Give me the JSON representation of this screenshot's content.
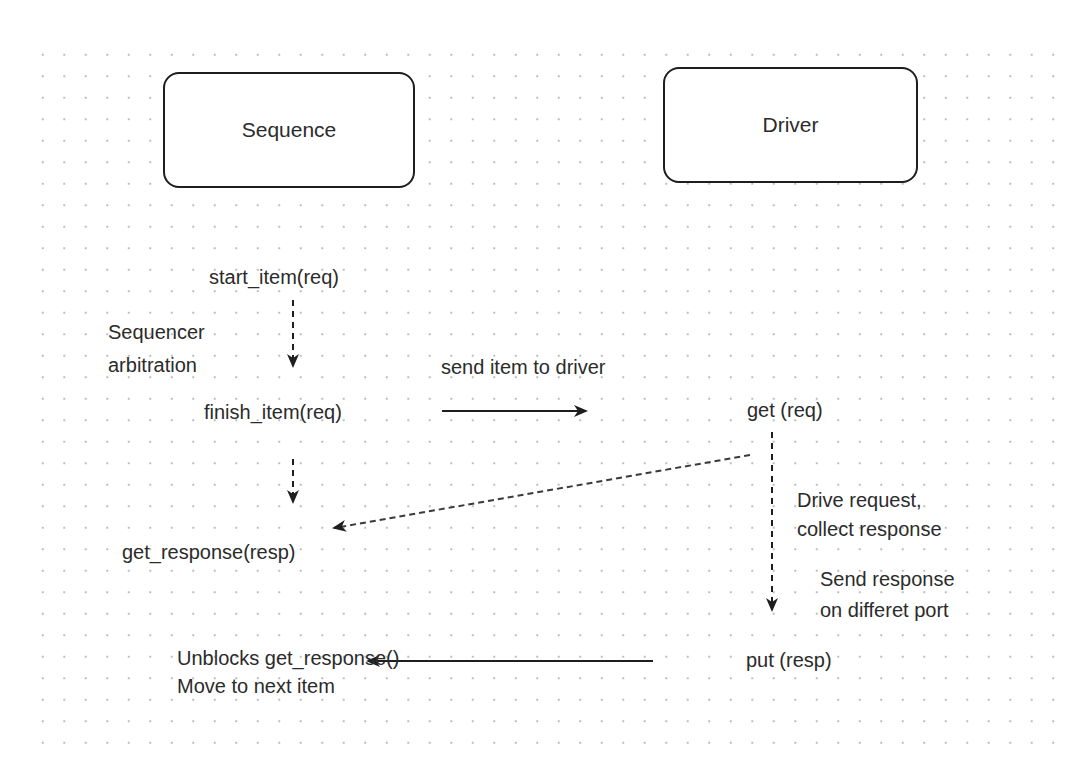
{
  "diagram": {
    "nodes": [
      {
        "id": "sequence",
        "label": "Sequence"
      },
      {
        "id": "driver",
        "label": "Driver"
      }
    ],
    "labels": {
      "start_item": "start_item(req)",
      "sequencer_arbitration_line1": "Sequencer",
      "sequencer_arbitration_line2": "arbitration",
      "finish_item": "finish_item(req)",
      "send_item_to_driver": "send item to driver",
      "get_req": "get (req)",
      "get_response": "get_response(resp)",
      "drive_request_line1": "Drive request,",
      "drive_request_line2": "collect response",
      "send_response_line1": "Send response",
      "send_response_line2": "on differet port",
      "put_resp": "put (resp)",
      "unblocks_line1": "Unblocks get_response()",
      "unblocks_line2": "Move to next item"
    },
    "edges": [
      {
        "from": "start_item",
        "to": "finish_item",
        "style": "dashed",
        "label": "Sequencer arbitration"
      },
      {
        "from": "finish_item",
        "to": "get_req",
        "style": "solid",
        "label": "send item to driver"
      },
      {
        "from": "finish_item",
        "to": "get_response",
        "style": "dashed"
      },
      {
        "from": "get_req",
        "to": "get_response",
        "style": "dashed"
      },
      {
        "from": "get_req",
        "to": "put_resp",
        "style": "dashed",
        "label": "Drive request, collect response"
      },
      {
        "from": "put_resp",
        "to": "unblocks",
        "style": "solid",
        "label": "Send response on differet port"
      }
    ],
    "colors": {
      "stroke": "#1e1e1e",
      "text": "#2b2b2b",
      "grid_dot": "#bcbcbc",
      "background": "#ffffff"
    }
  }
}
